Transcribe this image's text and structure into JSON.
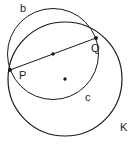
{
  "diagram": {
    "circles": [
      {
        "name": "b",
        "cx": 53,
        "cy": 54,
        "r": 45.5,
        "label": "b",
        "label_x": 20,
        "label_y": 12
      },
      {
        "name": "K",
        "cx": 65,
        "cy": 79,
        "r": 57,
        "label": "K",
        "label_x": 120,
        "label_y": 131
      }
    ],
    "points": [
      {
        "name": "P",
        "x": 10,
        "y": 70,
        "label": "P",
        "label_x": 19,
        "label_y": 79
      },
      {
        "name": "Q",
        "x": 96,
        "y": 38,
        "label": "Q",
        "label_x": 91,
        "label_y": 52
      },
      {
        "name": "midpoint",
        "x": 53,
        "y": 54
      },
      {
        "name": "center-K",
        "x": 65,
        "y": 79
      }
    ],
    "segment": {
      "from": "P",
      "to": "Q"
    },
    "other_labels": [
      {
        "text": "c",
        "x": 85,
        "y": 101
      }
    ],
    "stroke_color": "#1a1a1a"
  }
}
